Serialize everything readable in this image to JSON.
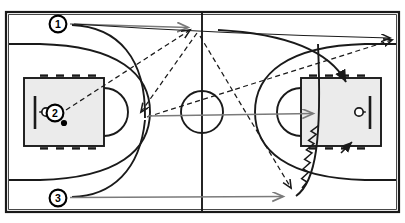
{
  "diagram": {
    "sport": "basketball",
    "view": "full-court-horizontal"
  },
  "colors": {
    "court_fill": "#ffffff",
    "court_line": "#1a1a1a",
    "key_fill": "#ebebeb",
    "pass_gray": "#7a7a7a",
    "cut_black": "#1a1a1a",
    "dash_black": "#1a1a1a",
    "marker_fill": "#ffffff",
    "marker_stroke": "#000000",
    "ball_fill": "#000000"
  },
  "court": {
    "border": {
      "x": 6,
      "y": 12,
      "width": 393,
      "height": 200
    },
    "halfcourt_line_x": 202,
    "center_circle": {
      "cx": 202,
      "cy": 112,
      "r": 21
    },
    "left_key": {
      "x": 24,
      "y": 78,
      "width": 80,
      "height": 68
    },
    "right_key": {
      "x": 301,
      "y": 78,
      "width": 80,
      "height": 68
    },
    "left_ft_circle": {
      "cx": 104,
      "cy": 112,
      "r": 24
    },
    "right_ft_circle": {
      "cx": 301,
      "cy": 112,
      "r": 24
    },
    "left_hoop": {
      "cx": 46,
      "cy": 112,
      "r": 4
    },
    "right_hoop": {
      "cx": 359,
      "cy": 112,
      "r": 4
    },
    "left_backboard": {
      "x": 35,
      "y_top": 96,
      "y_bottom": 129
    },
    "right_backboard": {
      "x": 370,
      "y_top": 96,
      "y_bottom": 129
    }
  },
  "players": [
    {
      "id": "1",
      "label": "1",
      "x": 58,
      "y": 24,
      "position": "top-left-wing",
      "role": "passer-cutter"
    },
    {
      "id": "2",
      "label": "2",
      "x": 55,
      "y": 113,
      "position": "left-basket",
      "role": "ball-handler",
      "has_ball": true
    },
    {
      "id": "3",
      "label": "3",
      "x": 58,
      "y": 198,
      "position": "bottom-left-wing",
      "role": "passer"
    }
  ],
  "ball": {
    "x": 64,
    "y": 122,
    "r": 3
  },
  "actions": [
    {
      "name": "pass-from-1-right",
      "type": "pass",
      "style": "solid-gray",
      "from": [
        70,
        24
      ],
      "to": [
        193,
        28
      ]
    },
    {
      "name": "pass-long-to-right-corner",
      "type": "pass",
      "style": "solid-gray",
      "from": [
        74,
        24
      ],
      "to": [
        400,
        36
      ]
    },
    {
      "name": "cut-player-1-curve",
      "type": "cut",
      "style": "solid-black-curve",
      "from": [
        72,
        25
      ],
      "to": [
        143,
        118
      ]
    },
    {
      "name": "pass-from-2-up",
      "type": "pass",
      "style": "dashed",
      "from": [
        66,
        110
      ],
      "to": [
        190,
        32
      ]
    },
    {
      "name": "pass-down-to-elbow",
      "type": "pass",
      "style": "dashed",
      "from": [
        196,
        34
      ],
      "to": [
        141,
        116
      ]
    },
    {
      "name": "pass-up-right-long",
      "type": "pass",
      "style": "dashed",
      "from": [
        146,
        116
      ],
      "to": [
        398,
        40
      ]
    },
    {
      "name": "pass-diagonal-to-baseline",
      "type": "pass",
      "style": "dashed",
      "from": [
        199,
        36
      ],
      "to": [
        292,
        191
      ]
    },
    {
      "name": "pass-from-3-right",
      "type": "pass",
      "style": "solid-gray",
      "from": [
        70,
        198
      ],
      "to": [
        288,
        196
      ]
    },
    {
      "name": "dribble-to-right-basket",
      "type": "dribble",
      "style": "squiggle",
      "from": [
        303,
        188
      ],
      "to": [
        352,
        148
      ]
    },
    {
      "name": "cut-curve-into-right-key",
      "type": "cut",
      "style": "solid-black-curve",
      "from": [
        218,
        30
      ],
      "to": [
        348,
        86
      ]
    },
    {
      "name": "drive-center-to-right-key",
      "type": "drive",
      "style": "solid-gray",
      "from": [
        204,
        112
      ],
      "to": [
        318,
        112
      ]
    },
    {
      "name": "baseline-curve-left",
      "type": "cut",
      "style": "solid-black-curve",
      "from": [
        72,
        196
      ],
      "to": [
        168,
        22
      ]
    },
    {
      "name": "baseline-curve-right",
      "type": "cut",
      "style": "solid-black-curve",
      "from": [
        300,
        196
      ],
      "to": [
        320,
        40
      ]
    }
  ],
  "legend": {
    "pass_label": "pass",
    "cut_label": "cut",
    "dribble_label": "dribble"
  }
}
